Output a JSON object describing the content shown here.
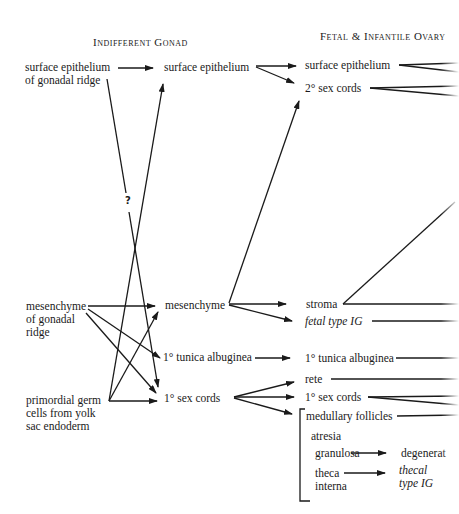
{
  "headers": {
    "indifferent_gonad": "Indifferent Gonad",
    "fetal_infantile_ovary": "Fetal & Infantile Ovary"
  },
  "column1": {
    "surface_epithelium_ridge": [
      "surface epithelium",
      "of gonadal ridge"
    ],
    "mesenchyme_ridge": [
      "mesenchyme",
      "of gonadal",
      "ridge"
    ],
    "primordial_germ_cells": [
      "primordial germ",
      "cells from yolk",
      "sac endoderm"
    ]
  },
  "column2": {
    "surface_epithelium": "surface epithelium",
    "mesenchyme": "mesenchyme",
    "tunica_albuginea": "1° tunica albuginea",
    "sex_cords": "1° sex cords"
  },
  "column3": {
    "surface_epithelium": "surface epithelium",
    "secondary_sex_cords": "2° sex cords",
    "stroma": "stroma",
    "fetal_type_ig": "fetal type IG",
    "tunica_albuginea": "1° tunica albuginea",
    "rete": "rete",
    "sex_cords": "1° sex cords",
    "medullary_follicles": "medullary follicles",
    "atresia": "atresia",
    "granulosa": "granulosa",
    "degenerate": "degenerat",
    "theca_interna": [
      "theca",
      "interna"
    ],
    "thecal_type_ig": [
      "thecal",
      "type IG"
    ]
  },
  "annotations": {
    "question_mark": "?"
  }
}
